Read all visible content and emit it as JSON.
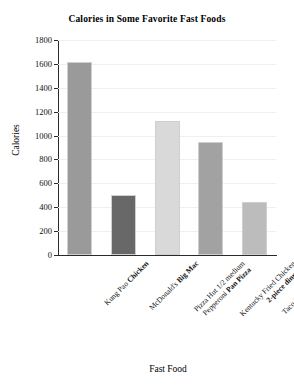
{
  "chart_data": {
    "type": "bar",
    "title": "Calories in Some Favorite Fast Foods",
    "xlabel": "Fast Food",
    "ylabel": "Calories",
    "ylim": [
      0,
      1800
    ],
    "ytick_step": 200,
    "grid": true,
    "legend": "none",
    "yticks": [
      "1800",
      "1600",
      "1400",
      "1200",
      "1000",
      "800",
      "600",
      "400",
      "200",
      "0"
    ],
    "categories": [
      "Kung Pao Chicken",
      "McDonald's Big Mac",
      "Pizza Hut 1/2 medium Pepperoni Pan Pizza",
      "Kentucky Fried Chicken 2-piece dinner",
      "Taco Bell Beef Burrito"
    ],
    "values": [
      1620,
      500,
      1120,
      950,
      440
    ],
    "bars": [
      {
        "label_plain": "Kung Pao ",
        "label_bold": "Chicken",
        "label_line2_plain": "",
        "label_line2_bold": "",
        "value": 1620,
        "color": "#9a9a9a"
      },
      {
        "label_plain": "McDonald's ",
        "label_bold": "Big Mac",
        "label_line2_plain": "",
        "label_line2_bold": "",
        "value": 500,
        "color": "#686868"
      },
      {
        "label_plain": "Pizza Hut 1/2 medium",
        "label_bold": "",
        "label_line2_plain": "Pepperoni ",
        "label_line2_bold": "Pan Pizza",
        "value": 1120,
        "color": "#d9d9d9"
      },
      {
        "label_plain": "Kentucky Fried Chicken",
        "label_bold": "",
        "label_line2_plain": "",
        "label_line2_bold": "2-piece dinner",
        "value": 950,
        "color": "#a2a2a2"
      },
      {
        "label_plain": "Taco Bell ",
        "label_bold": "Beef Burrito",
        "label_line2_plain": "",
        "label_line2_bold": "",
        "value": 440,
        "color": "#bcbcbc"
      }
    ]
  }
}
